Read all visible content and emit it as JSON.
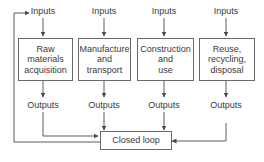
{
  "diagram": {
    "type": "flowchart",
    "stages": [
      {
        "input_label": "Inputs",
        "title_lines": [
          "Raw",
          "materials",
          "acquisition"
        ],
        "output_label": "Outputs"
      },
      {
        "input_label": "Inputs",
        "title_lines": [
          "Manufacture",
          "and",
          "transport"
        ],
        "output_label": "Outputs"
      },
      {
        "input_label": "Inputs",
        "title_lines": [
          "Construction",
          "and",
          "use"
        ],
        "output_label": "Outputs"
      },
      {
        "input_label": "Inputs",
        "title_lines": [
          "Reuse,",
          "recycling,",
          "disposal"
        ],
        "output_label": "Outputs"
      }
    ],
    "closed_loop": {
      "label": "Closed loop"
    },
    "colors": {
      "line": "#4a4a4a",
      "box_border": "#6a6a6a",
      "text": "#3a3a3a"
    }
  }
}
